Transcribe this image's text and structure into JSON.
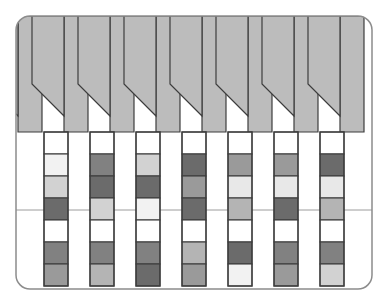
{
  "figure": {
    "type": "diagram",
    "canvas": {
      "width": 388,
      "height": 305
    },
    "frame": {
      "name": "rounded-rectangle-border",
      "x": 16,
      "y": 16,
      "width": 356,
      "height": 273,
      "corner_radius": 14,
      "stroke": "#8c8c8c",
      "stroke_width": 1.5,
      "fill": "#ffffff"
    },
    "palette": {
      "white": "#ffffff",
      "near_white": "#f2f2f2",
      "very_light_gray": "#e8e8e8",
      "light_gray": "#d2d2d2",
      "band_gray": "#bcbcbc",
      "medium_light_gray": "#b4b4b4",
      "medium_gray": "#9a9a9a",
      "medium_dark_gray": "#818181",
      "dark_gray": "#6b6b6b",
      "outline": "#3d3d3d",
      "thin_rule": "#9c9c9c"
    },
    "geometry": {
      "column_count": 7,
      "wide_column_width": 24,
      "gap_column_width": 22,
      "first_column_x": 44,
      "column_pitch": 46,
      "band_top_y": 16,
      "band_bottom_y": 132,
      "diagonal_start_y": 84,
      "diagonal_end_y": 116,
      "blocks_top_y": 132,
      "blocks_bottom_y": 288,
      "block_height": 22,
      "rule_y": 210,
      "block_rows": 7
    },
    "rule_line": {
      "name": "horizontal-reference-rule",
      "y": 210,
      "stroke": "#9c9c9c",
      "stroke_width": 1
    },
    "columns": [
      {
        "index": 0,
        "x": 44,
        "label": "column-1",
        "band_shape": "full-height-with-left-diagonal",
        "blocks": [
          {
            "row": 0,
            "shade": "white"
          },
          {
            "row": 1,
            "shade": "near_white"
          },
          {
            "row": 2,
            "shade": "light_gray"
          },
          {
            "row": 3,
            "shade": "dark_gray"
          },
          {
            "row": 4,
            "shade": "white"
          },
          {
            "row": 5,
            "shade": "medium_dark_gray"
          },
          {
            "row": 6,
            "shade": "medium_gray"
          }
        ]
      },
      {
        "index": 1,
        "x": 90,
        "label": "column-2",
        "band_shape": "full-height-with-left-diagonal",
        "blocks": [
          {
            "row": 0,
            "shade": "white"
          },
          {
            "row": 1,
            "shade": "medium_dark_gray"
          },
          {
            "row": 2,
            "shade": "dark_gray"
          },
          {
            "row": 3,
            "shade": "light_gray"
          },
          {
            "row": 4,
            "shade": "white"
          },
          {
            "row": 5,
            "shade": "medium_dark_gray"
          },
          {
            "row": 6,
            "shade": "medium_light_gray"
          }
        ]
      },
      {
        "index": 2,
        "x": 136,
        "label": "column-3",
        "band_shape": "full-height-with-left-diagonal",
        "blocks": [
          {
            "row": 0,
            "shade": "white"
          },
          {
            "row": 1,
            "shade": "light_gray"
          },
          {
            "row": 2,
            "shade": "dark_gray"
          },
          {
            "row": 3,
            "shade": "near_white"
          },
          {
            "row": 4,
            "shade": "white"
          },
          {
            "row": 5,
            "shade": "medium_dark_gray"
          },
          {
            "row": 6,
            "shade": "dark_gray"
          }
        ]
      },
      {
        "index": 3,
        "x": 182,
        "label": "column-4",
        "band_shape": "full-height-with-left-diagonal",
        "blocks": [
          {
            "row": 0,
            "shade": "white"
          },
          {
            "row": 1,
            "shade": "dark_gray"
          },
          {
            "row": 2,
            "shade": "medium_gray"
          },
          {
            "row": 3,
            "shade": "dark_gray"
          },
          {
            "row": 4,
            "shade": "white"
          },
          {
            "row": 5,
            "shade": "medium_light_gray"
          },
          {
            "row": 6,
            "shade": "medium_gray"
          }
        ]
      },
      {
        "index": 4,
        "x": 228,
        "label": "column-5",
        "band_shape": "full-height-with-left-diagonal",
        "blocks": [
          {
            "row": 0,
            "shade": "white"
          },
          {
            "row": 1,
            "shade": "medium_gray"
          },
          {
            "row": 2,
            "shade": "very_light_gray"
          },
          {
            "row": 3,
            "shade": "medium_light_gray"
          },
          {
            "row": 4,
            "shade": "white"
          },
          {
            "row": 5,
            "shade": "dark_gray"
          },
          {
            "row": 6,
            "shade": "near_white"
          }
        ]
      },
      {
        "index": 5,
        "x": 274,
        "label": "column-6",
        "band_shape": "full-height-with-left-diagonal",
        "blocks": [
          {
            "row": 0,
            "shade": "white"
          },
          {
            "row": 1,
            "shade": "medium_gray"
          },
          {
            "row": 2,
            "shade": "very_light_gray"
          },
          {
            "row": 3,
            "shade": "dark_gray"
          },
          {
            "row": 4,
            "shade": "white"
          },
          {
            "row": 5,
            "shade": "medium_dark_gray"
          },
          {
            "row": 6,
            "shade": "medium_gray"
          }
        ]
      },
      {
        "index": 6,
        "x": 320,
        "label": "column-7",
        "band_shape": "full-height-with-left-diagonal",
        "blocks": [
          {
            "row": 0,
            "shade": "white"
          },
          {
            "row": 1,
            "shade": "dark_gray"
          },
          {
            "row": 2,
            "shade": "very_light_gray"
          },
          {
            "row": 3,
            "shade": "medium_light_gray"
          },
          {
            "row": 4,
            "shade": "white"
          },
          {
            "row": 5,
            "shade": "medium_dark_gray"
          },
          {
            "row": 6,
            "shade": "light_gray"
          }
        ]
      }
    ],
    "band_segments": [
      {
        "index": 0,
        "label": "band-segment-1",
        "x": 18,
        "width": 24,
        "diagonal": "leading-edge"
      },
      {
        "index": 1,
        "label": "band-segment-2",
        "x": 64,
        "width": 24,
        "diagonal": "leading-edge"
      },
      {
        "index": 2,
        "label": "band-segment-3",
        "x": 110,
        "width": 24,
        "diagonal": "leading-edge"
      },
      {
        "index": 3,
        "label": "band-segment-4",
        "x": 156,
        "width": 24,
        "diagonal": "leading-edge"
      },
      {
        "index": 4,
        "label": "band-segment-5",
        "x": 202,
        "width": 24,
        "diagonal": "leading-edge"
      },
      {
        "index": 5,
        "label": "band-segment-6",
        "x": 248,
        "width": 24,
        "diagonal": "leading-edge"
      },
      {
        "index": 6,
        "label": "band-segment-7",
        "x": 294,
        "width": 24,
        "diagonal": "leading-edge"
      },
      {
        "index": 7,
        "label": "band-segment-8",
        "x": 340,
        "width": 24,
        "diagonal": "leading-edge"
      }
    ]
  }
}
